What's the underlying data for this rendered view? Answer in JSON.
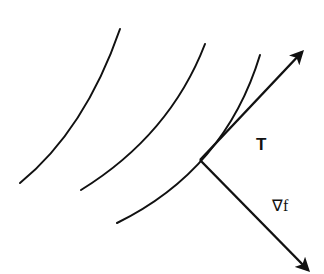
{
  "diagram": {
    "type": "level curves with tangent and gradient vectors",
    "labels": {
      "tangent": "T",
      "gradient": "∇f"
    },
    "colors": {
      "ink": "#111111",
      "background": "#ffffff"
    },
    "level_curves": [
      {
        "id": "curve-1",
        "from": [
          20,
          183
        ],
        "to": [
          120,
          29
        ]
      },
      {
        "id": "curve-2",
        "from": [
          81,
          190
        ],
        "to": [
          205,
          44
        ]
      },
      {
        "id": "curve-3",
        "from": [
          117,
          223
        ],
        "to": [
          260,
          55
        ]
      }
    ],
    "vectors": [
      {
        "id": "tangent",
        "label": "T",
        "from": [
          200,
          160
        ],
        "to": [
          304,
          50
        ]
      },
      {
        "id": "gradient",
        "label": "∇f",
        "from": [
          200,
          160
        ],
        "to": [
          310,
          272
        ]
      }
    ]
  }
}
